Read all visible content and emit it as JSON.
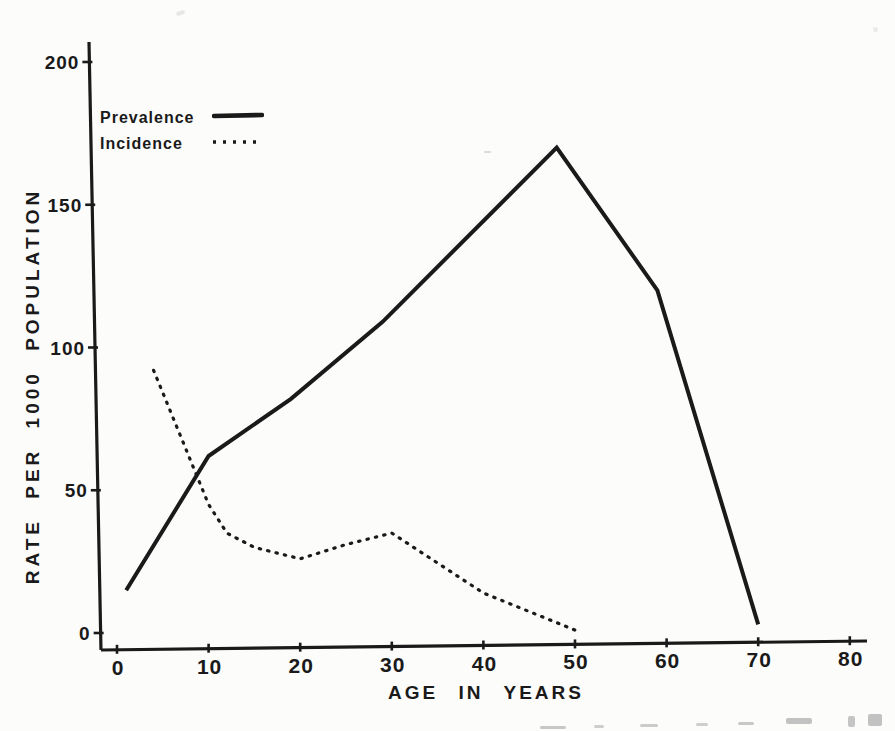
{
  "figure": {
    "background_color": "#fcfcfb",
    "ink_color": "#1a1a1a"
  },
  "legend": {
    "entries": [
      {
        "label": "Prevalence",
        "style": "solid"
      },
      {
        "label": "Incidence",
        "style": "dotted"
      }
    ]
  },
  "chart_data": {
    "type": "line",
    "title": "",
    "xlabel": "AGE IN YEARS",
    "ylabel": "RATE PER 1000 POPULATION",
    "xlim": [
      0,
      80
    ],
    "ylim": [
      0,
      200
    ],
    "x_ticks": [
      0,
      10,
      20,
      30,
      40,
      50,
      60,
      70,
      80
    ],
    "y_ticks": [
      0,
      50,
      100,
      150,
      200
    ],
    "grid": false,
    "legend_position": "upper-left",
    "series": [
      {
        "name": "Prevalence",
        "line_style": "solid",
        "points": [
          [
            1,
            15
          ],
          [
            10,
            62
          ],
          [
            19,
            82
          ],
          [
            29,
            109
          ],
          [
            48,
            170
          ],
          [
            59,
            120
          ],
          [
            70,
            3
          ]
        ]
      },
      {
        "name": "Incidence",
        "line_style": "dotted",
        "points": [
          [
            4,
            92
          ],
          [
            10,
            45
          ],
          [
            12,
            35
          ],
          [
            15,
            30
          ],
          [
            20,
            26
          ],
          [
            25,
            31
          ],
          [
            30,
            35
          ],
          [
            40,
            14
          ],
          [
            50,
            1
          ]
        ]
      }
    ]
  }
}
